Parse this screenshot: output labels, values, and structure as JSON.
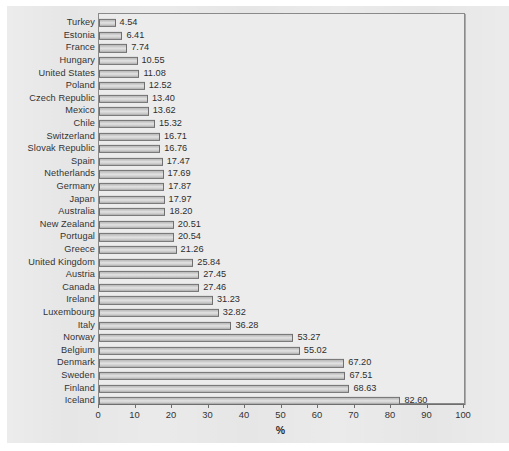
{
  "chart_data": {
    "type": "bar",
    "orientation": "horizontal",
    "title": "",
    "xlabel": "%",
    "ylabel": "",
    "xlim": [
      0,
      100
    ],
    "xticks": [
      0,
      10,
      20,
      30,
      40,
      50,
      60,
      70,
      80,
      90,
      100
    ],
    "grid": false,
    "legend": null,
    "value_label_format": "2 decimals",
    "categories": [
      "Turkey",
      "Estonia",
      "France",
      "Hungary",
      "United States",
      "Poland",
      "Czech Republic",
      "Mexico",
      "Chile",
      "Switzerland",
      "Slovak Republic",
      "Spain",
      "Netherlands",
      "Germany",
      "Japan",
      "Australia",
      "New Zealand",
      "Portugal",
      "Greece",
      "United Kingdom",
      "Austria",
      "Canada",
      "Ireland",
      "Luxembourg",
      "Italy",
      "Norway",
      "Belgium",
      "Denmark",
      "Sweden",
      "Finland",
      "Iceland"
    ],
    "values": [
      4.54,
      6.41,
      7.74,
      10.55,
      11.08,
      12.52,
      13.4,
      13.62,
      15.32,
      16.71,
      16.76,
      17.47,
      17.69,
      17.87,
      17.97,
      18.2,
      20.51,
      20.54,
      21.26,
      25.84,
      27.45,
      27.46,
      31.23,
      32.82,
      36.28,
      53.27,
      55.02,
      67.2,
      67.51,
      68.63,
      82.6
    ],
    "value_labels": [
      "4.54",
      "6.41",
      "7.74",
      "10.55",
      "11.08",
      "12.52",
      "13.40",
      "13.62",
      "15.32",
      "16.71",
      "16.76",
      "17.47",
      "17.69",
      "17.87",
      "17.97",
      "18.20",
      "20.51",
      "20.54",
      "21.26",
      "25.84",
      "27.45",
      "27.46",
      "31.23",
      "32.82",
      "36.28",
      "53.27",
      "55.02",
      "67.20",
      "67.51",
      "68.63",
      "82.60"
    ],
    "tick_labels": [
      "0",
      "10",
      "20",
      "30",
      "40",
      "50",
      "60",
      "70",
      "80",
      "90",
      "100"
    ],
    "colors": {
      "bar_fill": "#cfcfcf",
      "bar_border": "#6f6f6f",
      "plot_background": "#ececec",
      "page_background": "#e6e6e6",
      "axis": "#6e6e6e",
      "text": "#333333"
    }
  }
}
